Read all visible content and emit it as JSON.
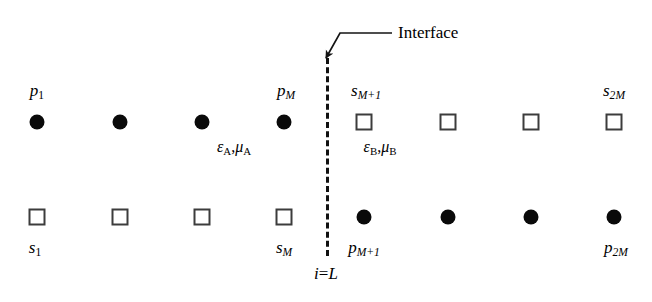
{
  "figure": {
    "width": 652,
    "height": 302,
    "background": "#ffffff",
    "ink_color": "#000000"
  },
  "annotation": {
    "interface_label": "Interface",
    "interface_label_x": 398,
    "interface_label_y": 24,
    "arrow_tip_x": 326,
    "arrow_tip_y": 58,
    "leader_elbow_x": 340,
    "leader_elbow_y": 33,
    "leader_start_x": 392,
    "leader_start_y": 33
  },
  "interface": {
    "x": 326,
    "y_top": 58,
    "y_bottom": 256,
    "dash_color": "#111111",
    "coordinate_label_prefix": "i",
    "coordinate_label_equals": "=",
    "coordinate_label_value": "L",
    "coordinate_label_x": 326,
    "coordinate_label_y": 273
  },
  "regions": [
    {
      "name": "region-a",
      "material_symbol_epsilon": "ε",
      "material_subscript_1": "A",
      "material_comma": ",",
      "material_symbol_mu": "μ",
      "material_subscript_2": "A",
      "label_x": 234,
      "label_y": 148
    },
    {
      "name": "region-b",
      "material_symbol_epsilon": "ε",
      "material_subscript_1": "B",
      "material_comma": ",",
      "material_symbol_mu": "μ",
      "material_subscript_2": "B",
      "label_x": 380,
      "label_y": 148
    }
  ],
  "rows": [
    {
      "name": "top-row",
      "y": 122,
      "nodes": [
        {
          "shape": "dot",
          "x": 37
        },
        {
          "shape": "dot",
          "x": 120
        },
        {
          "shape": "dot",
          "x": 202
        },
        {
          "shape": "dot",
          "x": 284
        },
        {
          "shape": "square",
          "x": 364
        },
        {
          "shape": "square",
          "x": 448
        },
        {
          "shape": "square",
          "x": 531
        },
        {
          "shape": "square",
          "x": 614
        }
      ]
    },
    {
      "name": "bottom-row",
      "y": 217,
      "nodes": [
        {
          "shape": "square",
          "x": 37
        },
        {
          "shape": "square",
          "x": 120
        },
        {
          "shape": "square",
          "x": 202
        },
        {
          "shape": "square",
          "x": 284
        },
        {
          "shape": "dot",
          "x": 364
        },
        {
          "shape": "dot",
          "x": 448
        },
        {
          "shape": "dot",
          "x": 531
        },
        {
          "shape": "dot",
          "x": 614
        }
      ]
    }
  ],
  "node_labels": [
    {
      "name": "label-p-1",
      "base": "p",
      "sub": "1",
      "sub_style": "roman",
      "x": 37,
      "y": 92
    },
    {
      "name": "label-p-m",
      "base": "p",
      "sub": "M",
      "sub_style": "italic",
      "x": 286,
      "y": 92
    },
    {
      "name": "label-s-m-plus-1",
      "base": "s",
      "sub": "M+1",
      "sub_style": "italic",
      "x": 366,
      "y": 92
    },
    {
      "name": "label-s-2m",
      "base": "s",
      "sub": "2M",
      "sub_style": "italic",
      "x": 614,
      "y": 92
    },
    {
      "name": "label-s-1",
      "base": "s",
      "sub": "1",
      "sub_style": "roman",
      "x": 35,
      "y": 249
    },
    {
      "name": "label-s-m",
      "base": "s",
      "sub": "M",
      "sub_style": "italic",
      "x": 284,
      "y": 249
    },
    {
      "name": "label-p-m-plus-1",
      "base": "p",
      "sub": "M+1",
      "sub_style": "italic",
      "x": 364,
      "y": 249
    },
    {
      "name": "label-p-2m",
      "base": "p",
      "sub": "2M",
      "sub_style": "italic",
      "x": 616,
      "y": 249
    }
  ]
}
